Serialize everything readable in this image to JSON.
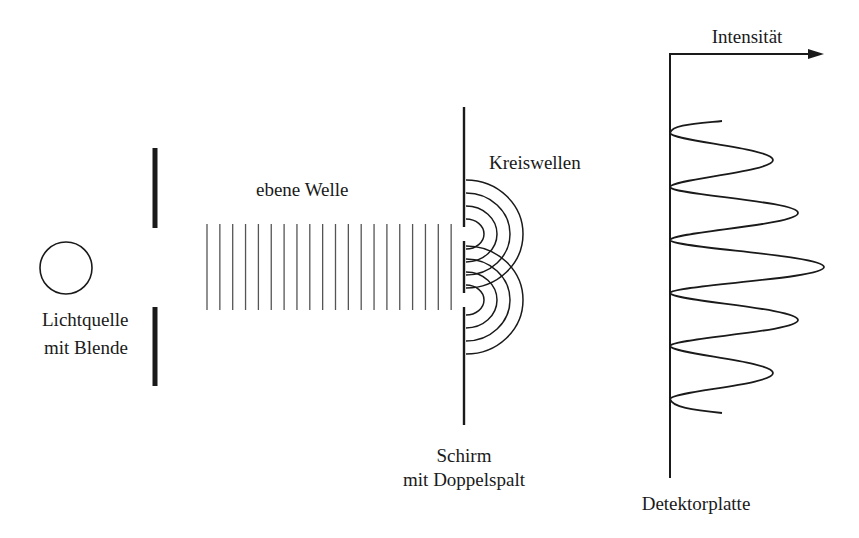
{
  "labels": {
    "light_source_line1": "Lichtquelle",
    "light_source_line2": "mit Blende",
    "plane_wave": "ebene Welle",
    "circular_waves": "Kreiswellen",
    "screen_line1": "Schirm",
    "screen_line2": "mit Doppelspalt",
    "intensity_axis": "Intensität",
    "detector": "Detektorplatte"
  },
  "colors": {
    "ink": "#1a1a1a",
    "background": "#ffffff"
  },
  "geometry": {
    "light_source": {
      "cx": 66,
      "cy": 268,
      "r": 26
    },
    "aperture": {
      "x": 155,
      "upper": [
        148,
        228
      ],
      "lower": [
        307,
        386
      ]
    },
    "plane_wave": {
      "x_start": 207,
      "spacing": 12.85,
      "count": 20,
      "y_top": 224,
      "y_bottom": 310
    },
    "screen": {
      "x": 464,
      "y_top": 107,
      "y_bottom": 425,
      "slit1": [
        227,
        241
      ],
      "slit2": [
        293,
        307
      ]
    },
    "slit_centers": [
      234,
      300
    ],
    "arc_radii": [
      15,
      28,
      41,
      54
    ],
    "detector_axis": {
      "x": 670,
      "y_top": 54,
      "y_bottom": 478,
      "arrow_end_x": 824
    },
    "intensity_peaks": [
      {
        "y": 160,
        "x": 773
      },
      {
        "y": 213,
        "x": 798
      },
      {
        "y": 267,
        "x": 824
      },
      {
        "y": 320,
        "x": 798
      },
      {
        "y": 373,
        "x": 773
      }
    ],
    "intensity_minima_y": [
      133,
      187,
      240,
      293,
      346,
      399
    ],
    "intensity_ends": {
      "start": {
        "x": 722,
        "y": 121
      },
      "end": {
        "x": 722,
        "y": 413
      }
    }
  }
}
